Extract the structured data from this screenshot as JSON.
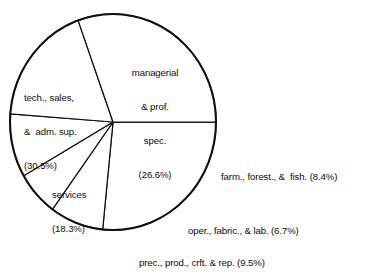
{
  "chart_data": {
    "type": "pie",
    "title": "",
    "subtitle": "",
    "xlabel": "",
    "ylabel": "",
    "legend_position": "none",
    "grid": false,
    "units": "percent",
    "categories": [
      "managerial & prof. spec.",
      "farm., forest., &  fish.",
      "oper., fabric., & lab.",
      "prec., prod., crft. & rep.",
      "services",
      "tech., sales, &  adm. sup."
    ],
    "values": [
      26.6,
      8.4,
      6.7,
      9.5,
      18.3,
      30.5
    ],
    "slices": [
      {
        "name": "managerial",
        "label_lines": [
          "managerial",
          "& prof.",
          "spec.",
          "(26.6%)"
        ],
        "label_text": "managerial & prof. spec. (26.6%)",
        "value": 26.6,
        "value_text": "(26.6%)",
        "placement": "inside",
        "color": "#ffffff"
      },
      {
        "name": "farm-forest-fish",
        "label_lines": [
          "farm., forest., &  fish. (8.4%)"
        ],
        "label_text": "farm., forest., &  fish. (8.4%)",
        "value": 8.4,
        "value_text": "(8.4%)",
        "placement": "outside",
        "color": "#ffffff"
      },
      {
        "name": "oper-fabric-lab",
        "label_lines": [
          "oper., fabric., & lab. (6.7%)"
        ],
        "label_text": "oper., fabric., & lab. (6.7%)",
        "value": 6.7,
        "value_text": "(6.7%)",
        "placement": "outside",
        "color": "#ffffff"
      },
      {
        "name": "prec-prod-crft-rep",
        "label_lines": [
          "prec., prod., crft. & rep. (9.5%)"
        ],
        "label_text": "prec., prod., crft. & rep. (9.5%)",
        "value": 9.5,
        "value_text": "(9.5%)",
        "placement": "outside",
        "color": "#ffffff"
      },
      {
        "name": "services",
        "label_lines": [
          "services",
          "(18.3%)"
        ],
        "label_text": "services (18.3%)",
        "value": 18.3,
        "value_text": "(18.3%)",
        "placement": "inside",
        "color": "#ffffff"
      },
      {
        "name": "tech-sales-adm-sup",
        "label_lines": [
          "tech., sales,",
          "&  adm. sup.",
          "(30.5%)"
        ],
        "label_text": "tech., sales, &  adm. sup. (30.5%)",
        "value": 30.5,
        "value_text": "(30.5%)",
        "placement": "inside",
        "color": "#ffffff"
      }
    ],
    "geometry": {
      "cx": 113,
      "cy": 122,
      "rx": 103,
      "ry": 108,
      "start_angle_deg": 0,
      "direction": "clockwise"
    },
    "style": {
      "stroke": "#111111",
      "fill": "#ffffff",
      "background": "#ffffff"
    }
  },
  "labels": {
    "managerial": {
      "l1": "managerial",
      "l2": "& prof.",
      "l3": "spec.",
      "l4": "(26.6%)"
    },
    "tech": {
      "l1": "tech., sales,",
      "l2": "&  adm. sup.",
      "l3": "(30.5%)"
    },
    "services": {
      "l1": "services",
      "l2": "(18.3%)"
    },
    "farm": {
      "l1": "farm., forest., &  fish. (8.4%)"
    },
    "oper": {
      "l1": "oper., fabric., & lab. (6.7%)"
    },
    "prec": {
      "l1": "prec., prod., crft. & rep. (9.5%)"
    }
  }
}
